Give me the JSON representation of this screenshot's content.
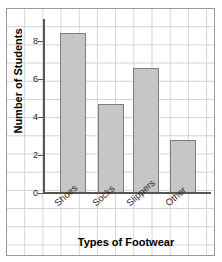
{
  "chart_data": {
    "type": "bar",
    "title": "",
    "subtitle": "",
    "categories": [
      "Shoes",
      "Socks",
      "Slippers",
      "Other"
    ],
    "values": [
      9,
      5,
      7,
      3
    ],
    "series": [
      {
        "name": "Number of Students",
        "values": [
          9,
          5,
          7,
          3
        ]
      }
    ],
    "xlabel": "Types of Footwear",
    "ylabel": "Number of Students",
    "ylim": [
      0,
      9.6
    ],
    "yticks": [
      0,
      2,
      4,
      6,
      8
    ],
    "ytick_labels": [
      "0",
      "2",
      "4",
      "6",
      "8"
    ],
    "xtick_labels": [
      "Shoes",
      "Socks",
      "Slippers",
      "Other"
    ],
    "grid": true,
    "grid_style": "graph-paper",
    "legend": false,
    "legend_position": "none",
    "bar_fill_color": "#c6c6c6",
    "bar_edge_color": "#7d7d7d",
    "axis_color": "#555555",
    "grid_color": "#d2d2d2",
    "text_color": "#000000",
    "annotations": []
  },
  "axes": {
    "y_title": "Number of Students",
    "x_title": "Types of Footwear",
    "y_ticks": [
      {
        "label": "8",
        "value": 8
      },
      {
        "label": "6",
        "value": 6
      },
      {
        "label": "4",
        "value": 4
      },
      {
        "label": "2",
        "value": 2
      },
      {
        "label": "0",
        "value": 0
      }
    ]
  },
  "bars": [
    {
      "label": "Shoes",
      "value": 9
    },
    {
      "label": "Socks",
      "value": 5
    },
    {
      "label": "Slippers",
      "value": 7
    },
    {
      "label": "Other",
      "value": 3
    }
  ]
}
